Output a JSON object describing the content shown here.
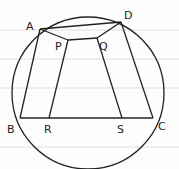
{
  "diagram": {
    "type": "geometry",
    "labels": {
      "A": "A",
      "B": "B",
      "C": "C",
      "D": "D",
      "P": "P",
      "Q": "Q",
      "R": "R",
      "S": "S"
    },
    "points": {
      "A": [
        40,
        29
      ],
      "D": [
        121,
        22
      ],
      "B": [
        20,
        118
      ],
      "C": [
        153,
        118
      ],
      "P": [
        68,
        40
      ],
      "Q": [
        97,
        38
      ],
      "R": [
        49,
        118
      ],
      "S": [
        122,
        118
      ]
    },
    "circle": {
      "cx": 88,
      "cy": 93,
      "r": 76
    },
    "segments": [
      [
        "A",
        "D"
      ],
      [
        "A",
        "B"
      ],
      [
        "D",
        "C"
      ],
      [
        "B",
        "C"
      ],
      [
        "A",
        "P"
      ],
      [
        "P",
        "Q"
      ],
      [
        "Q",
        "D"
      ],
      [
        "P",
        "R"
      ],
      [
        "Q",
        "S"
      ]
    ]
  }
}
